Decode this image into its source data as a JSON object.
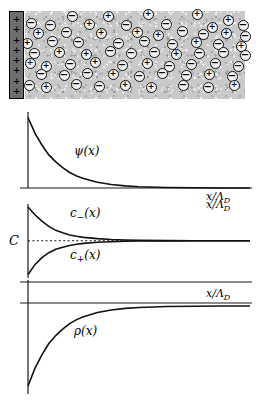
{
  "figure": {
    "axis_label_x": "x/Λ",
    "axis_label_x_sub": "D"
  },
  "electrolyte": {
    "name": "electrolyte-region",
    "wall_charge_sign": "+",
    "wall_charge_count": 8,
    "positive_ion_symbol": "+",
    "negative_ion_symbol": "−",
    "background_color": "#c9c9c9",
    "wall_color": "#6e6e6e",
    "ions": [
      {
        "x": 72,
        "y": 16,
        "s": "-"
      },
      {
        "x": 108,
        "y": 16,
        "s": "+"
      },
      {
        "x": 148,
        "y": 14,
        "s": "+"
      },
      {
        "x": 197,
        "y": 14,
        "s": "+"
      },
      {
        "x": 228,
        "y": 20,
        "s": "+"
      },
      {
        "x": 31,
        "y": 23,
        "s": "-"
      },
      {
        "x": 50,
        "y": 25,
        "s": "-"
      },
      {
        "x": 89,
        "y": 24,
        "s": "+"
      },
      {
        "x": 126,
        "y": 25,
        "s": "-"
      },
      {
        "x": 166,
        "y": 24,
        "s": "-"
      },
      {
        "x": 212,
        "y": 27,
        "s": "+"
      },
      {
        "x": 243,
        "y": 25,
        "s": "-"
      },
      {
        "x": 38,
        "y": 33,
        "s": "+"
      },
      {
        "x": 66,
        "y": 32,
        "s": "-"
      },
      {
        "x": 101,
        "y": 33,
        "s": "+"
      },
      {
        "x": 137,
        "y": 32,
        "s": "+"
      },
      {
        "x": 158,
        "y": 35,
        "s": "+"
      },
      {
        "x": 182,
        "y": 31,
        "s": "-"
      },
      {
        "x": 203,
        "y": 34,
        "s": "-"
      },
      {
        "x": 226,
        "y": 33,
        "s": "+"
      },
      {
        "x": 245,
        "y": 36,
        "s": "-"
      },
      {
        "x": 27,
        "y": 43,
        "s": "+"
      },
      {
        "x": 52,
        "y": 41,
        "s": "-"
      },
      {
        "x": 78,
        "y": 42,
        "s": "-"
      },
      {
        "x": 118,
        "y": 43,
        "s": "-"
      },
      {
        "x": 144,
        "y": 41,
        "s": "-"
      },
      {
        "x": 172,
        "y": 44,
        "s": "-"
      },
      {
        "x": 196,
        "y": 42,
        "s": "+"
      },
      {
        "x": 218,
        "y": 44,
        "s": "-"
      },
      {
        "x": 241,
        "y": 46,
        "s": "+"
      },
      {
        "x": 34,
        "y": 53,
        "s": "-"
      },
      {
        "x": 59,
        "y": 52,
        "s": "+"
      },
      {
        "x": 86,
        "y": 54,
        "s": "+"
      },
      {
        "x": 110,
        "y": 51,
        "s": "-"
      },
      {
        "x": 131,
        "y": 53,
        "s": "-"
      },
      {
        "x": 154,
        "y": 52,
        "s": "-"
      },
      {
        "x": 176,
        "y": 54,
        "s": "+"
      },
      {
        "x": 199,
        "y": 53,
        "s": "-"
      },
      {
        "x": 223,
        "y": 52,
        "s": "-"
      },
      {
        "x": 245,
        "y": 55,
        "s": "-"
      },
      {
        "x": 30,
        "y": 63,
        "s": "+"
      },
      {
        "x": 46,
        "y": 66,
        "s": "+"
      },
      {
        "x": 70,
        "y": 64,
        "s": "-"
      },
      {
        "x": 95,
        "y": 62,
        "s": "+"
      },
      {
        "x": 122,
        "y": 65,
        "s": "-"
      },
      {
        "x": 147,
        "y": 63,
        "s": "+"
      },
      {
        "x": 169,
        "y": 66,
        "s": "-"
      },
      {
        "x": 191,
        "y": 64,
        "s": "-"
      },
      {
        "x": 215,
        "y": 63,
        "s": "-"
      },
      {
        "x": 238,
        "y": 66,
        "s": "-"
      },
      {
        "x": 41,
        "y": 74,
        "s": "-"
      },
      {
        "x": 64,
        "y": 75,
        "s": "-"
      },
      {
        "x": 87,
        "y": 73,
        "s": "-"
      },
      {
        "x": 113,
        "y": 74,
        "s": "+"
      },
      {
        "x": 139,
        "y": 76,
        "s": "-"
      },
      {
        "x": 162,
        "y": 73,
        "s": "-"
      },
      {
        "x": 186,
        "y": 75,
        "s": "-"
      },
      {
        "x": 209,
        "y": 74,
        "s": "+"
      },
      {
        "x": 232,
        "y": 76,
        "s": "-"
      },
      {
        "x": 29,
        "y": 85,
        "s": "-"
      },
      {
        "x": 46,
        "y": 87,
        "s": "+"
      },
      {
        "x": 76,
        "y": 84,
        "s": "-"
      },
      {
        "x": 99,
        "y": 86,
        "s": "-"
      },
      {
        "x": 125,
        "y": 85,
        "s": "+"
      },
      {
        "x": 151,
        "y": 87,
        "s": "+"
      },
      {
        "x": 183,
        "y": 85,
        "s": "-"
      },
      {
        "x": 208,
        "y": 87,
        "s": "-"
      },
      {
        "x": 234,
        "y": 85,
        "s": "+"
      }
    ]
  },
  "chart_data": [
    {
      "type": "line",
      "name": "potential-plot",
      "title": "",
      "xlabel": "x/Λ_D",
      "ylabel": "",
      "curve_label": "ψ(x)",
      "description": "Electrostatic potential decaying exponentially from the wall",
      "x": [
        0,
        0.25,
        0.5,
        0.75,
        1,
        1.25,
        1.5,
        1.75,
        2,
        2.5,
        3,
        3.5,
        4,
        5,
        6,
        7,
        8
      ],
      "y": [
        1.0,
        0.78,
        0.61,
        0.47,
        0.37,
        0.29,
        0.22,
        0.17,
        0.135,
        0.082,
        0.05,
        0.03,
        0.018,
        0.0067,
        0.0025,
        0.0009,
        0.0003
      ],
      "xlim": [
        0,
        8
      ],
      "ylim": [
        0,
        1.05
      ],
      "grid": false
    },
    {
      "type": "line",
      "name": "concentration-plot",
      "title": "",
      "xlabel": "x/Λ_D",
      "ylabel": "C",
      "reference_label": "C",
      "reference_value": 1.0,
      "reference_style": "dotted",
      "description": "Counter-ion and co-ion concentrations converging to bulk value C",
      "x": [
        0,
        0.25,
        0.5,
        0.75,
        1,
        1.25,
        1.5,
        1.75,
        2,
        2.5,
        3,
        3.5,
        4,
        5,
        6,
        7,
        8
      ],
      "series": [
        {
          "name": "c_{-}(x)",
          "label": "c−(x)",
          "values": [
            2.1,
            1.85,
            1.64,
            1.47,
            1.34,
            1.26,
            1.19,
            1.145,
            1.11,
            1.07,
            1.042,
            1.026,
            1.016,
            1.006,
            1.002,
            1.001,
            1.0
          ]
        },
        {
          "name": "c_{+}(x)",
          "label": "c+(x)",
          "values": [
            -0.1,
            0.22,
            0.45,
            0.61,
            0.72,
            0.79,
            0.845,
            0.885,
            0.915,
            0.95,
            0.97,
            0.982,
            0.99,
            0.996,
            0.999,
            1.0,
            1.0
          ]
        }
      ],
      "xlim": [
        0,
        8
      ],
      "ylim": [
        -0.15,
        2.2
      ],
      "grid": false
    },
    {
      "type": "line",
      "name": "charge-density-plot",
      "title": "",
      "xlabel": "x/Λ_D",
      "ylabel": "",
      "curve_label": "ρ(x)",
      "description": "Net charge density, negative at the wall and rising to zero in the bulk",
      "x": [
        0,
        0.25,
        0.5,
        0.75,
        1,
        1.25,
        1.5,
        1.75,
        2,
        2.5,
        3,
        3.5,
        4,
        5,
        6,
        7,
        8
      ],
      "y": [
        -1.0,
        -0.78,
        -0.61,
        -0.47,
        -0.37,
        -0.29,
        -0.22,
        -0.17,
        -0.135,
        -0.082,
        -0.05,
        -0.03,
        -0.018,
        -0.0067,
        -0.0025,
        -0.0009,
        -0.0003
      ],
      "xlim": [
        0,
        8
      ],
      "ylim": [
        -1.05,
        0.25
      ],
      "grid": false
    }
  ],
  "labels": {
    "psi": "ψ(x)",
    "c_minus": "c",
    "c_minus_sub": "−",
    "c_minus_tail": "(x)",
    "c_plus": "c",
    "c_plus_sub": "+",
    "c_plus_tail": "(x)",
    "rho": "ρ(x)",
    "C": "C",
    "x_axis": "x/Λ",
    "x_axis_sub": "D"
  }
}
